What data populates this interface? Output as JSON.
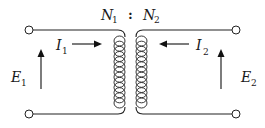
{
  "diagram": {
    "type": "ideal-transformer-schematic",
    "ratio_label": {
      "primary": {
        "symbol": "N",
        "subscript": "1"
      },
      "separator": ":",
      "secondary": {
        "symbol": "N",
        "subscript": "2"
      }
    },
    "primary": {
      "current": {
        "symbol": "I",
        "subscript": "1",
        "direction": "right"
      },
      "voltage": {
        "symbol": "E",
        "subscript": "1",
        "direction": "up"
      }
    },
    "secondary": {
      "current": {
        "symbol": "I",
        "subscript": "2",
        "direction": "left"
      },
      "voltage": {
        "symbol": "E",
        "subscript": "2",
        "direction": "up"
      }
    },
    "coil_turns_each": 13,
    "colors": {
      "line": "#222222",
      "background": "#ffffff"
    }
  }
}
